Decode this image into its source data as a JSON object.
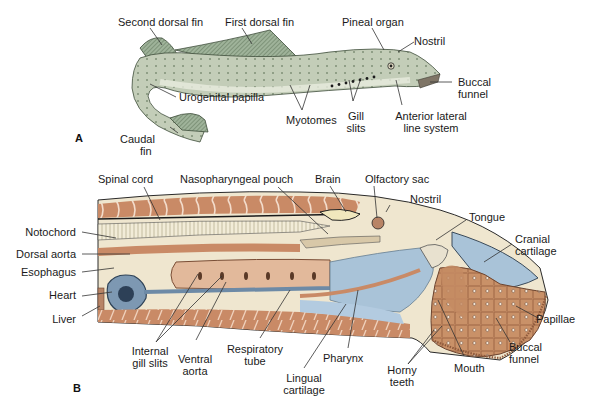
{
  "figure": {
    "panels": [
      {
        "id": "A",
        "letter": "A",
        "description": "External lateral view of lamprey",
        "labels": {
          "second_dorsal_fin": "Second dorsal fin",
          "first_dorsal_fin": "First dorsal fin",
          "pineal_organ": "Pineal organ",
          "nostril": "Nostril",
          "buccal_funnel_1": "Buccal",
          "buccal_funnel_2": "funnel",
          "urogenital_papilla": "Urogenital papilla",
          "myotomes": "Myotomes",
          "gill_slits_1": "Gill",
          "gill_slits_2": "slits",
          "anterior_lateral_1": "Anterior lateral",
          "anterior_lateral_2": "line system",
          "caudal_fin_1": "Caudal",
          "caudal_fin_2": "fin"
        }
      },
      {
        "id": "B",
        "letter": "B",
        "description": "Sagittal section of lamprey head region",
        "labels": {
          "spinal_cord": "Spinal cord",
          "nasopharyngeal_pouch": "Nasopharyngeal pouch",
          "brain": "Brain",
          "olfactory_sac": "Olfactory sac",
          "nostril": "Nostril",
          "tongue": "Tongue",
          "cranial_cartilage_1": "Cranial",
          "cranial_cartilage_2": "cartilage",
          "notochord": "Notochord",
          "dorsal_aorta": "Dorsal aorta",
          "esophagus": "Esophagus",
          "heart": "Heart",
          "liver": "Liver",
          "papillae": "Papillae",
          "buccal_funnel_1": "Buccal",
          "buccal_funnel_2": "funnel",
          "internal_gill_slits_1": "Internal",
          "internal_gill_slits_2": "gill slits",
          "ventral_aorta_1": "Ventral",
          "ventral_aorta_2": "aorta",
          "respiratory_tube_1": "Respiratory",
          "respiratory_tube_2": "tube",
          "lingual_cartilage_1": "Lingual",
          "lingual_cartilage_2": "cartilage",
          "pharynx": "Pharynx",
          "horny_teeth_1": "Horny",
          "horny_teeth_2": "teeth",
          "mouth": "Mouth"
        }
      }
    ],
    "colors": {
      "body_green": "#b9c6b0",
      "body_dark_green": "#6f8a6a",
      "belly": "#e6e8dc",
      "muscle": "#c98a66",
      "muscle_dark": "#a8664a",
      "cream": "#efe6cf",
      "cartilage_blue": "#a9c3d8",
      "vessel_blue": "#6d8aa6",
      "funnel_tan": "#c9926a",
      "outline": "#2a2a2a"
    }
  }
}
